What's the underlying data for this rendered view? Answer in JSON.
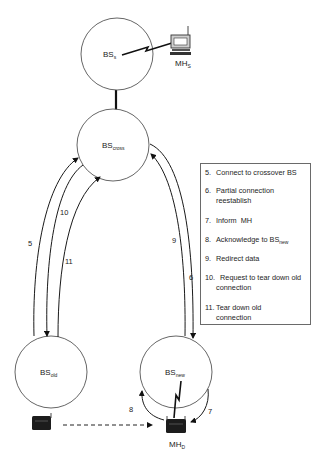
{
  "nodes": {
    "bs_s": {
      "label": "BS",
      "sub": "s"
    },
    "bs_cross": {
      "label": "BS",
      "sub": "cross"
    },
    "bs_old": {
      "label": "BS",
      "sub": "old"
    },
    "bs_new": {
      "label": "BS",
      "sub": "new"
    },
    "mh_s": {
      "label": "MH",
      "sub": "S"
    },
    "mh_d": {
      "label": "MH",
      "sub": "D"
    }
  },
  "edges": {
    "e5": {
      "label": "5",
      "from": "BS_old",
      "to": "BS_cross"
    },
    "e10": {
      "label": "10",
      "from": "BS_cross",
      "to": "BS_old"
    },
    "e11": {
      "label": "11",
      "from": "BS_old",
      "to": "BS_cross"
    },
    "e9": {
      "label": "9",
      "from": "BS_new",
      "to": "BS_cross"
    },
    "e6": {
      "label": "6",
      "from": "BS_cross",
      "to": "BS_new"
    },
    "e7": {
      "label": "7",
      "from": "BS_new",
      "to": "MH_D"
    },
    "e8": {
      "label": "8",
      "from": "MH_D",
      "to": "BS_new"
    }
  },
  "legend": {
    "items": [
      {
        "num": "5.",
        "text": "Connect to crossover BS"
      },
      {
        "num": "6.",
        "text": "Partial connection",
        "cont": "reestablish"
      },
      {
        "num": "7.",
        "text": "Inform  MH"
      },
      {
        "num": "8.",
        "text": "Acknowledge to BS",
        "sub": "new"
      },
      {
        "num": "9.",
        "text": "Redirect data"
      },
      {
        "num": "10.",
        "text": "  Request to tear down old",
        "cont": "connection"
      },
      {
        "num": "11.",
        "text": "Tear down old",
        "cont": "connection"
      }
    ]
  },
  "colors": {
    "line": "#1a1a1a",
    "circle_stroke": "#555555",
    "device": "#1c1c1c"
  }
}
